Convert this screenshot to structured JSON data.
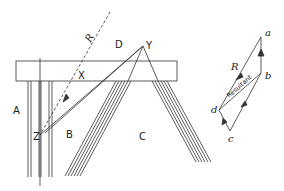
{
  "diagram": {
    "type": "force-diagram-truss",
    "region_labels": {
      "A": "A",
      "B": "B",
      "C": "C",
      "D": "D"
    },
    "point_labels": {
      "X": "X",
      "Y": "Y",
      "Z": "Z"
    },
    "line_labels": {
      "R": "R"
    },
    "vector_diagram": {
      "points": {
        "a": "a",
        "b": "b",
        "c": "c",
        "d": "d"
      },
      "R": "R",
      "resultant": "Resultant"
    },
    "stroke_color": "#333333",
    "background": "#ffffff"
  }
}
